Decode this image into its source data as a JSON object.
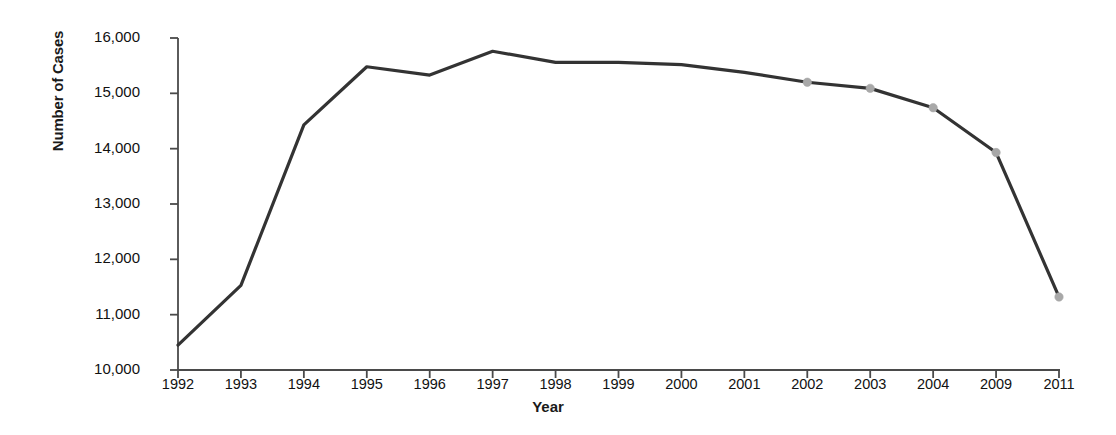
{
  "chart_data": {
    "type": "line",
    "title": "",
    "xlabel": "Year",
    "ylabel": "Number of Cases",
    "categories": [
      "1992",
      "1993",
      "1994",
      "1995",
      "1996",
      "1997",
      "1998",
      "1999",
      "2000",
      "2001",
      "2002",
      "2003",
      "2004",
      "2009",
      "2011"
    ],
    "values": [
      10450,
      11530,
      14430,
      15480,
      15330,
      15760,
      15560,
      15560,
      15520,
      15380,
      15200,
      15090,
      14740,
      13930,
      11320
    ],
    "series": [
      {
        "name": "Number of Cases",
        "values": [
          10450,
          11530,
          14430,
          15480,
          15330,
          15760,
          15560,
          15560,
          15520,
          15380,
          15200,
          15090,
          14740,
          13930,
          11320
        ],
        "line_color": "#333333",
        "marker_color": "#a8a8a8",
        "markers_at": [
          "2002",
          "2003",
          "2004",
          "2009",
          "2011"
        ]
      }
    ],
    "ylim": [
      10000,
      16000
    ],
    "ytick_values": [
      10000,
      11000,
      12000,
      13000,
      14000,
      15000,
      16000
    ],
    "ytick_labels": [
      "10,000",
      "11,000",
      "12,000",
      "13,000",
      "14,000",
      "15,000",
      "16,000"
    ],
    "grid": false,
    "legend": false,
    "legend_position": "none",
    "axis_color": "#4a4a4a",
    "background": "#ffffff"
  }
}
